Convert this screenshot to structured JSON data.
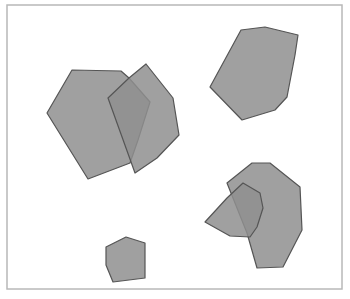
{
  "canvas": {
    "width": 350,
    "height": 299,
    "background": "#ffffff"
  },
  "frame": {
    "x": 7,
    "y": 5,
    "width": 335,
    "height": 284,
    "stroke": "#b8b8b8"
  },
  "style": {
    "fill": "#8f8f8f",
    "fill_opacity": 0.85,
    "stroke": "#555555"
  },
  "shapes": [
    {
      "id": "hexagon-left-large",
      "points": "72,70 121,71 129,78 150,102 138,140 130,163 88,179 47,113"
    },
    {
      "id": "heptagon-left-overlapping",
      "points": "146,64 173,98 179,135 157,158 135,173 108,98 129,78"
    },
    {
      "id": "octagon-top-right",
      "points": "241,30 265,27 298,35 295,55 287,97 275,110 242,120 210,87"
    },
    {
      "id": "polygon-bottom-right-large",
      "points": "252,163 270,163 300,187 302,230 283,267 257,268 247,233 227,183"
    },
    {
      "id": "polygon-bottom-right-small",
      "points": "243,183 260,193 263,208 257,227 250,237 230,236 205,222 227,198"
    },
    {
      "id": "pentagon-bottom-small",
      "points": "126,237 145,243 145,278 113,282 106,265 106,247"
    }
  ]
}
